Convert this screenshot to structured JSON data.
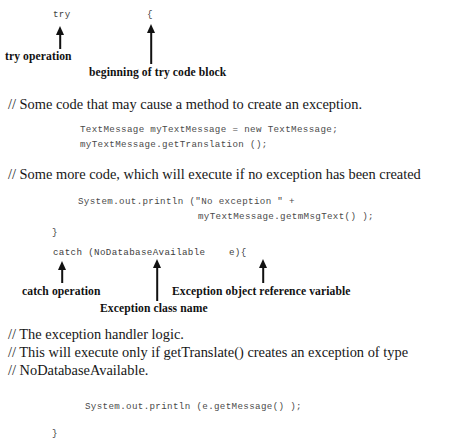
{
  "figure": {
    "type": "annotated-code-listing",
    "language": "java",
    "background_color": "#ffffff",
    "text_color": "#171717",
    "code_color": "#4a4a4a"
  },
  "code_lines": [
    {
      "id": "try-keyword",
      "text": "try",
      "x": 53,
      "y": 9
    },
    {
      "id": "try-open-brace",
      "text": "{",
      "x": 147,
      "y": 9
    },
    {
      "id": "new-textmessage",
      "text": "TextMessage myTextMessage = new TextMessage;",
      "x": 80,
      "y": 124
    },
    {
      "id": "get-translation-call",
      "text": "myTextMessage.getTranslation ();",
      "x": 80,
      "y": 139
    },
    {
      "id": "println-no-exception",
      "text": "System.out.println (\"No exception \" +",
      "x": 78,
      "y": 196
    },
    {
      "id": "println-no-exception-cont",
      "text": "myTextMessage.getmMsgText() );",
      "x": 198,
      "y": 211
    },
    {
      "id": "try-close-brace",
      "text": "}",
      "x": 52,
      "y": 227
    },
    {
      "id": "catch-clause",
      "text": "catch (NoDatabaseAvailable    e){",
      "x": 53,
      "y": 247
    },
    {
      "id": "println-get-message",
      "text": "System.out.println (e.getMessage() );",
      "x": 85,
      "y": 401
    },
    {
      "id": "catch-close-brace",
      "text": "}",
      "x": 52,
      "y": 428
    }
  ],
  "comments": [
    {
      "id": "comment-some-code",
      "text": "// Some code that may cause a method to create an exception.",
      "x": 8,
      "y": 96
    },
    {
      "id": "comment-some-more-code",
      "text": "// Some more code, which will execute if no exception has been created",
      "x": 8,
      "y": 166
    },
    {
      "id": "comment-handler-logic",
      "text": "// The exception handler logic.",
      "x": 8,
      "y": 326
    },
    {
      "id": "comment-this-will-execute",
      "text": "// This will execute only if getTranslate() creates an exception of type",
      "x": 8,
      "y": 344
    },
    {
      "id": "comment-nodatabaseavailable",
      "text": "// NoDatabaseAvailable.",
      "x": 8,
      "y": 362
    }
  ],
  "callouts": [
    {
      "id": "try-operation",
      "text": "try operation",
      "x": 5,
      "y": 50
    },
    {
      "id": "beginning-of-try-code-block",
      "text": "beginning of try code block",
      "x": 89,
      "y": 66
    },
    {
      "id": "catch-operation",
      "text": "catch operation",
      "x": 22,
      "y": 285
    },
    {
      "id": "exception-object-reference-variable",
      "text": "Exception object reference variable",
      "x": 172,
      "y": 285
    },
    {
      "id": "exception-class-name",
      "text": "Exception class name",
      "x": 100,
      "y": 302
    }
  ],
  "arrows": [
    {
      "id": "arrow-try-operation",
      "x": 60,
      "top": 26,
      "height": 23
    },
    {
      "id": "arrow-try-code-block",
      "x": 151,
      "top": 24,
      "height": 40
    },
    {
      "id": "arrow-catch-operation",
      "x": 62,
      "top": 261,
      "height": 22
    },
    {
      "id": "arrow-exception-class-name",
      "x": 157,
      "top": 259,
      "height": 42
    },
    {
      "id": "arrow-exception-object-reference",
      "x": 263,
      "top": 259,
      "height": 24
    }
  ]
}
